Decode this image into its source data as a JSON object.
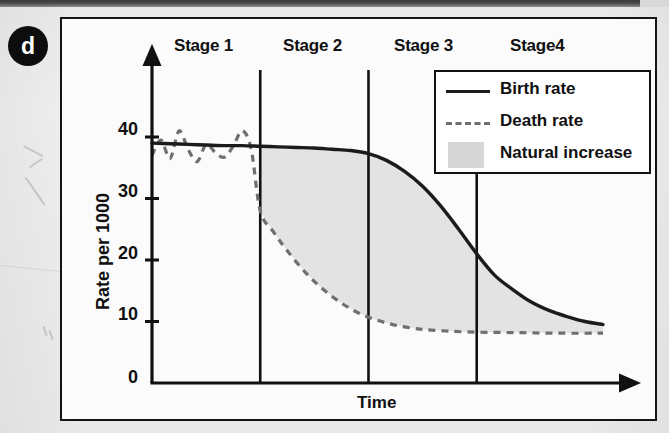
{
  "panel": {
    "badge_label": "d"
  },
  "chart_data": {
    "type": "line",
    "title": "",
    "xlabel": "Time",
    "ylabel": "Rate per 1000",
    "ylim": [
      0,
      45
    ],
    "xlim": [
      0,
      100
    ],
    "yticks": [
      "0",
      "10",
      "20",
      "30",
      "40"
    ],
    "ytick_values": [
      0,
      10,
      20,
      30,
      40
    ],
    "xticks": [],
    "grid": false,
    "legend_position": "top-right",
    "legend": [
      {
        "name": "Birth rate",
        "style": "solid",
        "color": "#1b1b1b"
      },
      {
        "name": "Death rate",
        "style": "dashed",
        "color": "#6f6f6f"
      },
      {
        "name": "Natural increase",
        "style": "fill",
        "color": "#d7d7d7"
      }
    ],
    "stages": [
      {
        "label": "Stage 1",
        "x_start": 0,
        "x_end": 24
      },
      {
        "label": "Stage 2",
        "x_start": 24,
        "x_end": 48
      },
      {
        "label": "Stage 3",
        "x_start": 48,
        "x_end": 72
      },
      {
        "label": "Stage4",
        "x_start": 72,
        "x_end": 100
      }
    ],
    "stage_divider_x": [
      24,
      48,
      72
    ],
    "series": [
      {
        "name": "Birth rate",
        "style": "solid",
        "x": [
          0,
          4,
          8,
          12,
          16,
          20,
          24,
          28,
          32,
          36,
          40,
          44,
          48,
          52,
          56,
          60,
          64,
          68,
          72,
          76,
          80,
          84,
          88,
          92,
          96,
          100
        ],
        "values": [
          39.0,
          38.9,
          38.8,
          38.7,
          38.6,
          38.6,
          38.5,
          38.4,
          38.3,
          38.2,
          38.0,
          37.8,
          37.3,
          36.2,
          34.4,
          32.0,
          28.8,
          25.0,
          21.0,
          17.5,
          15.2,
          13.2,
          11.8,
          10.8,
          10.0,
          9.5
        ]
      },
      {
        "name": "Death rate",
        "style": "dashed",
        "x": [
          0,
          2,
          4,
          6,
          8,
          10,
          12,
          14,
          16,
          18,
          20,
          22,
          24,
          27,
          30,
          34,
          38,
          42,
          46,
          50,
          54,
          58,
          62,
          70,
          80,
          90,
          100
        ],
        "values": [
          37.0,
          39.5,
          36.5,
          41.0,
          38.0,
          36.0,
          38.8,
          37.5,
          36.7,
          38.5,
          41.0,
          38.0,
          28.0,
          24.5,
          21.5,
          18.0,
          15.2,
          13.0,
          11.3,
          10.2,
          9.4,
          8.9,
          8.6,
          8.3,
          8.2,
          8.1,
          8.1
        ]
      }
    ],
    "fill_between": {
      "name": "Natural increase",
      "upper": "Birth rate",
      "lower": "Death rate",
      "x_start": 24,
      "x_end": 100,
      "color": "#e3e3e3"
    }
  }
}
